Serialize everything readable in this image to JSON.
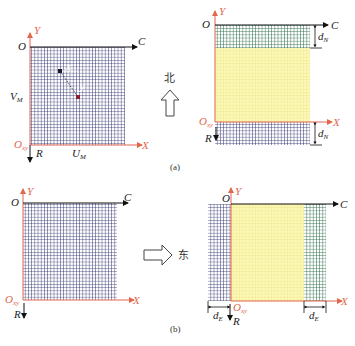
{
  "colors": {
    "blue_grid": "#3e3f7a",
    "green_grid": "#2f6e4c",
    "yellow_fill": "#fbf7a8",
    "yellow_grid": "#e8e07a",
    "axis_red": "#e2674f",
    "axis_black": "#111111"
  },
  "panel_a": {
    "caption": "(a)",
    "direction_label": "北",
    "direction_icon": "arrow-up-outline-icon",
    "left": {
      "origin_top": "O",
      "y_axis": "Y",
      "c_axis": "C",
      "origin_bottom": "O",
      "origin_bottom_sub": "xy",
      "x_axis": "X",
      "r_axis": "R",
      "v_label": "V",
      "v_sub": "M",
      "u_label": "U",
      "u_sub": "M",
      "point_x": "x",
      "point_y": "y"
    },
    "right": {
      "origin_top": "O",
      "y_axis": "Y",
      "c_axis": "C",
      "origin_bottom": "O",
      "origin_bottom_sub": "xy",
      "x_axis": "X",
      "r_axis": "R",
      "d_top": "d",
      "d_top_sub": "N",
      "d_bottom": "d",
      "d_bottom_sub": "N"
    }
  },
  "panel_b": {
    "caption": "(b)",
    "direction_label": "东",
    "direction_icon": "arrow-right-outline-icon",
    "left": {
      "origin_top": "O",
      "y_axis": "Y",
      "c_axis": "C",
      "origin_bottom": "O",
      "origin_bottom_sub": "xy",
      "x_axis": "X",
      "r_axis": "R"
    },
    "right": {
      "origin_top": "O",
      "y_axis": "Y",
      "c_axis": "C",
      "origin_bottom": "O",
      "origin_bottom_sub": "xy",
      "x_axis": "X",
      "r_axis": "R",
      "d_left": "d",
      "d_left_sub": "E",
      "d_right": "d",
      "d_right_sub": "E"
    }
  }
}
